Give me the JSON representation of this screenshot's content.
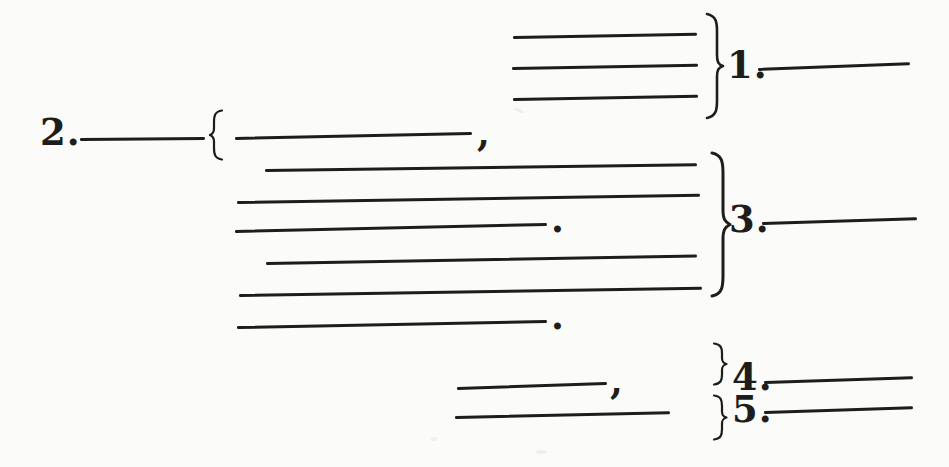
{
  "page": {
    "background": "#fbfbf9",
    "ink": "#1d1d1b"
  },
  "labels": {
    "item1": "1.",
    "item2": "2.",
    "item3": "3.",
    "item4": "4.",
    "item5": "5."
  },
  "punctuation": {
    "comma_after_item2_first_blank": ",",
    "period_after_group3_third_blank": ".",
    "period_after_blank_below_group3": ".",
    "comma_after_item4_blank": ","
  }
}
